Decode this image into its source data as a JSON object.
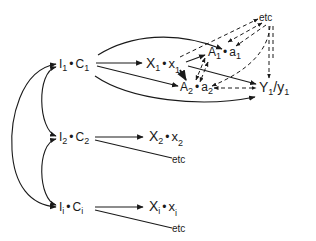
{
  "diagram": {
    "type": "path-diagram",
    "line_color": "#1a1a1a",
    "background": "#ffffff",
    "nodes": {
      "i1c1": {
        "main": "I",
        "sub1": "1",
        "dot": "•",
        "main2": "C",
        "sub2": "1"
      },
      "x1": {
        "main": "X",
        "sub1": "1",
        "dot": "•",
        "main2": "x",
        "sub2": "1"
      },
      "a1": {
        "main": "A",
        "sub1": "1",
        "dot": "•",
        "main2": "a",
        "sub2": "1"
      },
      "a2": {
        "main": "A",
        "sub1": "2",
        "dot": "•",
        "main2": "a",
        "sub2": "2"
      },
      "y1": {
        "main": "Y",
        "sub1": "1",
        "slash": "/",
        "main2": "y",
        "sub2": "1"
      },
      "etc_top": {
        "label": "etc"
      },
      "i2c2": {
        "main": "I",
        "sub1": "2",
        "dot": "•",
        "main2": "C",
        "sub2": "2"
      },
      "x2": {
        "main": "X",
        "sub1": "2",
        "dot": "•",
        "main2": "x",
        "sub2": "2"
      },
      "etc_2": {
        "label": "etc"
      },
      "iici": {
        "main": "I",
        "sub1": "i",
        "dot": "•",
        "main2": "C",
        "sub2": "i"
      },
      "xi": {
        "main": "X",
        "sub1": "i",
        "dot": "•",
        "main2": "x",
        "sub2": "i"
      },
      "etc_i": {
        "label": "etc"
      }
    },
    "edges": [
      {
        "from": "I1•C1",
        "to": "X1•x1",
        "style": "solid"
      },
      {
        "from": "I1•C1",
        "to": "A1•a1",
        "style": "solid",
        "curved": true
      },
      {
        "from": "I1•C1",
        "to": "A2•a2",
        "style": "solid"
      },
      {
        "from": "I1•C1",
        "to": "Y1/y1",
        "style": "solid",
        "curved": true
      },
      {
        "from": "X1•x1",
        "to": "A1•a1",
        "style": "solid"
      },
      {
        "from": "X1•x1",
        "to": "A2•a2",
        "style": "solid"
      },
      {
        "from": "X1•x1",
        "to": "Y1/y1",
        "style": "solid"
      },
      {
        "from": "A1•a1",
        "to": "A2•a2",
        "style": "dashed",
        "bidirectional": true
      },
      {
        "from": "A2•a2",
        "to": "Y1/y1",
        "style": "dashed",
        "bidirectional": true
      },
      {
        "from": "X1•x1",
        "to": "etc",
        "style": "dashed"
      },
      {
        "from": "etc",
        "to": "A1•a1",
        "style": "dashed",
        "bidirectional": true
      },
      {
        "from": "etc",
        "to": "A2•a2",
        "style": "dashed"
      },
      {
        "from": "etc",
        "to": "Y1/y1",
        "style": "dashed"
      },
      {
        "from": "I2•C2",
        "to": "X2•x2",
        "style": "solid"
      },
      {
        "from": "I2•C2",
        "to": "etc",
        "style": "solid"
      },
      {
        "from": "Ii•Ci",
        "to": "Xi•xi",
        "style": "solid"
      },
      {
        "from": "Ii•Ci",
        "to": "etc",
        "style": "solid"
      },
      {
        "from": "I1•C1",
        "to": "I2•C2",
        "style": "solid",
        "bidirectional": true
      },
      {
        "from": "I2•C2",
        "to": "Ii•Ci",
        "style": "solid",
        "bidirectional": true
      },
      {
        "from": "I1•C1",
        "to": "Ii•Ci",
        "style": "solid",
        "bidirectional": true
      }
    ]
  }
}
